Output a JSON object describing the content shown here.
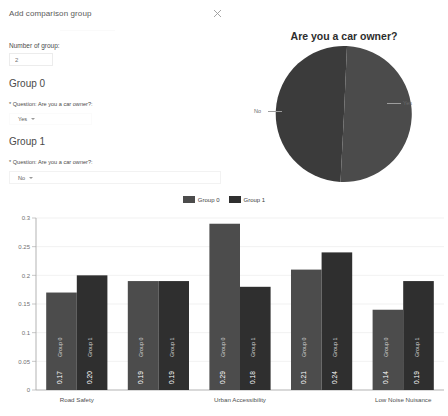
{
  "dialog": {
    "title": "Add comparison group",
    "close_icon": "close-icon",
    "number_of_group_label": "Number of group:",
    "number_of_group_value": "2",
    "groups": [
      {
        "heading": "Group 0",
        "question_label": "* Question: Are you a car owner?:",
        "answer_value": "Yes"
      },
      {
        "heading": "Group 1",
        "question_label": "* Question: Are you a car owner?:",
        "answer_value": "No"
      }
    ]
  },
  "pie_chart": {
    "title": "Are you a car owner?",
    "labels": {
      "no": "No",
      "yes": "Yes"
    }
  },
  "legend": {
    "items": [
      {
        "label": "Group 0",
        "color": "#4c4c4c"
      },
      {
        "label": "Group 1",
        "color": "#2f2f2f"
      }
    ]
  },
  "chart_data": [
    {
      "type": "pie",
      "title": "Are you a car owner?",
      "labels": [
        "No",
        "Yes"
      ],
      "values": [
        0.54,
        0.46
      ],
      "colors": [
        "#3b3b3b",
        "#4b4b4b"
      ],
      "legend_position": "outside-labels"
    },
    {
      "type": "bar",
      "title": "",
      "xlabel": "",
      "ylabel": "",
      "ylim": [
        0,
        0.3
      ],
      "yticks": [
        "0",
        "0.05",
        "0.1",
        "0.15",
        "0.2",
        "0.25",
        "0.3"
      ],
      "ytick_values": [
        0,
        0.05,
        0.1,
        0.15,
        0.2,
        0.25,
        0.3
      ],
      "grid": true,
      "legend_position": "top-center",
      "categories": [
        "Road Safety",
        "",
        "Urban Accessibility",
        "",
        "Low Noise Nuisance"
      ],
      "visible_tick_labels": [
        "Road Safety",
        "Urban Accessibility",
        "Low Noise Nuisance"
      ],
      "series": [
        {
          "name": "Group 0",
          "color": "#4c4c4c",
          "values": [
            0.17,
            0.19,
            0.29,
            0.21,
            0.14
          ]
        },
        {
          "name": "Group 1",
          "color": "#2f2f2f",
          "values": [
            0.2,
            0.19,
            0.18,
            0.24,
            0.19
          ]
        }
      ],
      "bar_labels": [
        [
          "0.17",
          "0.19",
          "0.29",
          "0.21",
          "0.14"
        ],
        [
          "0.20",
          "0.19",
          "0.18",
          "0.24",
          "0.19"
        ]
      ],
      "bar_series_labels": [
        [
          "Group 0",
          "Group 0",
          "Group 0",
          "Group 0",
          "Group 0"
        ],
        [
          "Group 1",
          "Group 1",
          "Group 1",
          "Group 1",
          "Group 1"
        ]
      ]
    }
  ]
}
